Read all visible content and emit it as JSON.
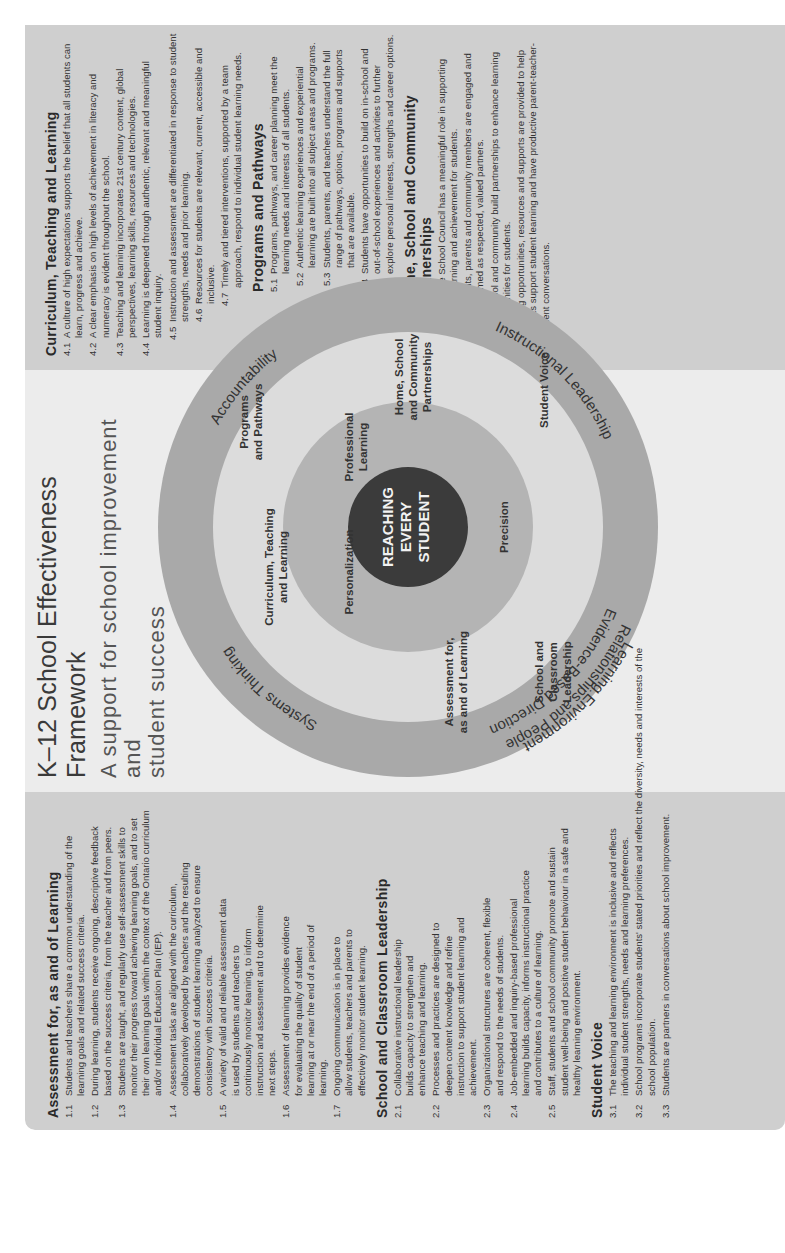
{
  "header": {
    "title": "K–12 School Effectiveness Framework",
    "subtitle_line1": "A support for school improvement and",
    "subtitle_line2": "student success"
  },
  "diagram": {
    "center": [
      "REACHING",
      "EVERY",
      "STUDENT"
    ],
    "outer_ring": [
      "Systems Thinking",
      "Accountability",
      "Instructional Leadership",
      "Evidence-Based Direction",
      "Learning Environment",
      "Relationships and People"
    ],
    "inner_disk": [
      "Personalization",
      "Precision",
      "Professional",
      "Learning"
    ],
    "middle_ring": {
      "curriculum": [
        "Curriculum, Teaching",
        "and Learning"
      ],
      "programs": [
        "Programs",
        "and Pathways"
      ],
      "home": [
        "Home, School",
        "and Community",
        "Partnerships"
      ],
      "student_voice": "Student Voice",
      "school_leadership": [
        "School and",
        "Classroom",
        "Leadership"
      ],
      "assessment": [
        "Assessment for,",
        "as and of Learning"
      ]
    },
    "colors": {
      "outer_ring": "#a9a9a9",
      "middle_ring": "#dcdcdc",
      "inner_disk": "#b4b4b4",
      "center": "#3b3b3b"
    }
  },
  "left_panel": {
    "sections": [
      {
        "title": "Assessment for, as and of Learning",
        "items": [
          {
            "num": "1.1",
            "text": "Students and teachers share a common understanding of the learning goals and related success criteria."
          },
          {
            "num": "1.2",
            "text": "During learning, students receive ongoing, descriptive feedback based on the success criteria, from the teacher and from peers."
          },
          {
            "num": "1.3",
            "text": "Students are taught, and regularly use self-assessment skills to monitor their progress toward achieving learning goals, and to set their own learning goals within the context of the Ontario curriculum and/or Individual Education Plan (IEP)."
          },
          {
            "num": "1.4",
            "text": "Assessment tasks are aligned with the curriculum, collaboratively developed by teachers and the resulting demonstrations of student learning analyzed to ensure consistency with success criteria."
          },
          {
            "num": "1.5",
            "text": "A variety of valid and reliable assessment data is used by students and teachers to continuously monitor learning, to inform instruction and assessment and to determine next steps."
          },
          {
            "num": "1.6",
            "text": "Assessment of learning provides evidence for evaluating the quality of student learning at or near the end of a period of learning."
          },
          {
            "num": "1.7",
            "text": "Ongoing communication is in place to allow students, teachers and parents to effectively monitor student learning."
          }
        ]
      },
      {
        "title": "School and Classroom Leadership",
        "items": [
          {
            "num": "2.1",
            "text": "Collaborative instructional leadership builds capacity to strengthen and enhance teaching and learning."
          },
          {
            "num": "2.2",
            "text": "Processes and practices are designed to deepen content knowledge and refine instruction to support student learning and achievement."
          },
          {
            "num": "2.3",
            "text": "Organizational structures are coherent, flexible and respond to the needs of students."
          },
          {
            "num": "2.4",
            "text": "Job-embedded and inquiry-based professional learning builds capacity, informs instructional practice and contributes to a culture of learning."
          },
          {
            "num": "2.5",
            "text": "Staff, students and school community promote and sustain student well-being and positive student behaviour in a safe and healthy learning environment."
          }
        ]
      },
      {
        "title": "Student Voice",
        "items": [
          {
            "num": "3.1",
            "text": "The teaching and learning environment is inclusive and reflects individual student strengths, needs and learning preferences."
          },
          {
            "num": "3.2",
            "text": "School programs incorporate students' stated priorities and reflect the diversity, needs and interests of the school population."
          },
          {
            "num": "3.3",
            "text": "Students are partners in conversations about school improvement."
          }
        ]
      }
    ]
  },
  "right_panel": {
    "sections": [
      {
        "title": "Curriculum, Teaching and Learning",
        "items": [
          {
            "num": "4.1",
            "text": "A culture of high expectations supports the belief that all students can learn, progress and achieve."
          },
          {
            "num": "4.2",
            "text": "A clear emphasis on high levels of achievement in literacy and numeracy is evident throughout the school."
          },
          {
            "num": "4.3",
            "text": "Teaching and learning incorporates 21st century content, global perspectives, learning skills, resources and technologies."
          },
          {
            "num": "4.4",
            "text": "Learning is deepened through authentic, relevant and meaningful student inquiry."
          },
          {
            "num": "4.5",
            "text": "Instruction and assessment are differentiated in response to student strengths, needs and prior learning."
          },
          {
            "num": "4.6",
            "text": "Resources for students are relevant, current, accessible and inclusive."
          },
          {
            "num": "4.7",
            "text": "Timely and tiered interventions, supported by a team approach, respond to individual student learning needs."
          }
        ]
      },
      {
        "title": "Programs and Pathways",
        "items": [
          {
            "num": "5.1",
            "text": "Programs, pathways, and career planning meet the learning needs and interests of all students."
          },
          {
            "num": "5.2",
            "text": "Authentic learning experiences and experiential learning are built into all subject areas and programs."
          },
          {
            "num": "5.3",
            "text": "Students, parents, and teachers understand the full range of pathways, options, programs and supports that are available."
          },
          {
            "num": "5.4",
            "text": "Students have opportunities to build on in-school and out-of-school experiences and activities to further explore personal interests, strengths and career options."
          }
        ]
      },
      {
        "title": "Home, School and Community Partnerships",
        "items": [
          {
            "num": "6.1",
            "text": "The School Council has a meaningful role in supporting learning and achievement for students."
          },
          {
            "num": "6.2",
            "text": "Students, parents and community members are engaged and welcomed as respected, valued partners."
          },
          {
            "num": "6.3",
            "text": "The school and community build partnerships to enhance learning opportunities for students."
          },
          {
            "num": "6.4",
            "text": "Learning opportunities, resources and supports are provided to help parents support student learning and have productive parent-teacher-student conversations."
          }
        ]
      }
    ]
  }
}
